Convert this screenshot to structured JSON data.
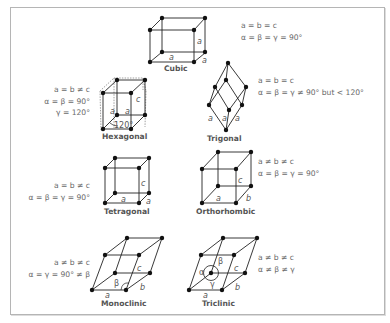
{
  "systems": [
    {
      "name": "Cubic",
      "lines": [
        "a = b = c",
        "α = β = γ = 90°"
      ]
    },
    {
      "name": "Hexagonal",
      "lines": [
        "a = b ≠ c",
        "α = β = 90°",
        "γ = 120°"
      ]
    },
    {
      "name": "Trigonal",
      "lines": [
        "a = b = c",
        "α = β = γ ≠ 90° but < 120°"
      ]
    },
    {
      "name": "Tetragonal",
      "lines": [
        "a = b ≠ c",
        "α = β = γ = 90°"
      ]
    },
    {
      "name": "Orthorhombic",
      "lines": [
        "a ≠ b ≠ c",
        "α = β = γ = 90°"
      ]
    },
    {
      "name": "Monoclinic",
      "lines": [
        "a ≠ b ≠ c",
        "α = γ = 90° ≠ β"
      ]
    },
    {
      "name": "Triclinic",
      "lines": [
        "a ≠ b ≠ c",
        "α ≠ β ≠ γ"
      ]
    }
  ],
  "edge_labels": {
    "cubic": [
      "a",
      "a",
      "a"
    ],
    "hexagonal": [
      "c",
      "a",
      "a",
      "120°"
    ],
    "trigonal": [
      "a",
      "a",
      "a"
    ],
    "tetragonal": [
      "c",
      "a",
      "a"
    ],
    "orthorhombic": [
      "c",
      "a",
      "b"
    ],
    "monoclinic": [
      "c",
      "β",
      "a",
      "b"
    ],
    "triclinic": [
      "β",
      "α",
      "γ",
      "c",
      "a",
      "b"
    ]
  }
}
